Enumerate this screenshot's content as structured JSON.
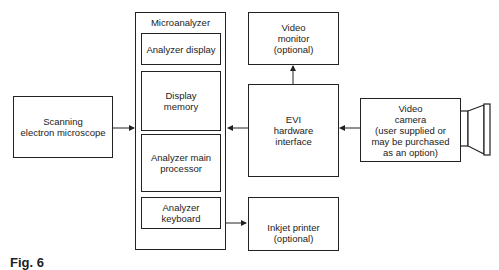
{
  "diagram": {
    "scanning_em": "Scanning\nelectron microscope",
    "microanalyzer": {
      "title": "Microanalyzer",
      "analyzer_display": "Analyzer display",
      "display_memory": "Display\nmemory",
      "main_processor": "Analyzer main\nprocessor",
      "keyboard": "Analyzer\nkeyboard"
    },
    "video_monitor": "Video\nmonitor\n(optional)",
    "evi_interface": "EVI\nhardware\ninterface",
    "video_camera": "Video\ncamera\n(user supplied or\nmay be purchased\nas an option)",
    "inkjet_printer": "Inkjet printer\n(optional)",
    "figure_label": "Fig. 6"
  }
}
